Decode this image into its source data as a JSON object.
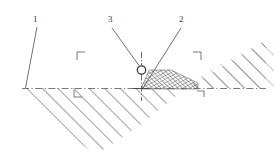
{
  "figure": {
    "background_color": "#ffffff",
    "line_color": "#5a5a5a",
    "hatch_color": "#8a8a8a",
    "wedge_hatch_color": "#4a4a4a",
    "label_color": "#3a3a3a",
    "width": 275,
    "height": 165
  },
  "callouts": [
    {
      "id": "callout-1",
      "label": "1",
      "label_x": 33,
      "label_y": 18,
      "leader": {
        "x1": 37,
        "y1": 28,
        "x2": 25,
        "y2": 88
      },
      "meaning": "ground-surface-reference-line"
    },
    {
      "id": "callout-3",
      "label": "3",
      "label_x": 108,
      "label_y": 18,
      "leader": {
        "x1": 113,
        "y1": 28,
        "x2": 139,
        "y2": 66
      },
      "meaning": "circular-load-point-marker"
    },
    {
      "id": "callout-2",
      "label": "2",
      "label_x": 180,
      "label_y": 18,
      "leader": {
        "x1": 181,
        "y1": 28,
        "x2": 143,
        "y2": 88
      },
      "meaning": "cross-hatched-stress-wedge"
    }
  ],
  "geometry": {
    "datum_line": {
      "name": "horizontal-datum-dash-dot-line",
      "x1": 22,
      "y1": 88,
      "x2": 266,
      "y2": 88,
      "style": "dash-dot"
    },
    "axis_marker": {
      "name": "vertical-axis-dash-dot-line",
      "x": 141,
      "y1": 52,
      "y2": 100,
      "style": "dash-dot"
    },
    "circle_marker": {
      "name": "load-point-circle",
      "cx": 141,
      "cy": 70,
      "r": 4.2
    },
    "ground_mass_outline": [
      [
        22,
        88
      ],
      [
        266,
        88
      ],
      [
        266,
        41
      ],
      [
        185,
        88
      ],
      [
        140,
        125
      ],
      [
        95,
        154
      ],
      [
        55,
        125
      ]
    ],
    "wedge_outline": [
      [
        141,
        89
      ],
      [
        197,
        89
      ],
      [
        197,
        83
      ],
      [
        170,
        70
      ],
      [
        148,
        70
      ]
    ]
  },
  "corner_brackets": [
    {
      "name": "bracket-upper-left",
      "x": 77,
      "y": 52,
      "orientation": "top-left"
    },
    {
      "name": "bracket-lower-left",
      "x": 74,
      "y": 90,
      "orientation": "bottom-left"
    },
    {
      "name": "bracket-upper-right",
      "x": 200,
      "y": 52,
      "orientation": "top-right"
    },
    {
      "name": "bracket-lower-right",
      "x": 196,
      "y": 90,
      "orientation": "bottom-right"
    }
  ]
}
